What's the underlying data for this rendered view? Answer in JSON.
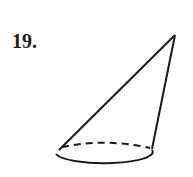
{
  "problem": {
    "number": "19."
  },
  "figure": {
    "type": "oblique cone",
    "stroke_color": "#1a1a1a",
    "apex": [
      175,
      35
    ],
    "base_center": [
      103,
      155
    ],
    "base_rx": 48,
    "base_ry": 11
  }
}
